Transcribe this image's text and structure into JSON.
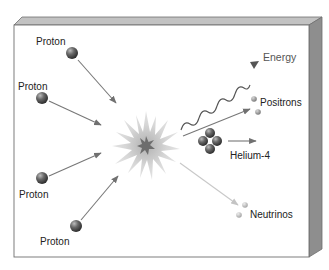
{
  "diagram": {
    "colors": {
      "box_face": "#ffffff",
      "box_top": "#bdbdbd",
      "box_side": "#8e8e8e",
      "box_edge": "#6f6f6f",
      "particle": "#5a5a5a",
      "arrow": "#777777",
      "neutrino_arrow": "#c8c8c8",
      "explosion_outer": "#d8d8d8",
      "explosion_core": "#6d6d6d"
    },
    "inputs": [
      {
        "label": "Proton",
        "icon": "proton-sphere-icon"
      },
      {
        "label": "Proton",
        "icon": "proton-sphere-icon"
      },
      {
        "label": "Proton",
        "icon": "proton-sphere-icon"
      },
      {
        "label": "Proton",
        "icon": "proton-sphere-icon"
      }
    ],
    "center": {
      "icon": "fusion-burst-icon"
    },
    "outputs": {
      "energy": {
        "label": "Energy",
        "icon": "wavy-energy-icon"
      },
      "positrons": {
        "label": "Positrons",
        "icon": "positron-dots-icon"
      },
      "helium": {
        "label": "Helium-4",
        "icon": "helium-nucleus-icon"
      },
      "neutrinos": {
        "label": "Neutrinos",
        "icon": "neutrino-dots-icon"
      }
    }
  }
}
